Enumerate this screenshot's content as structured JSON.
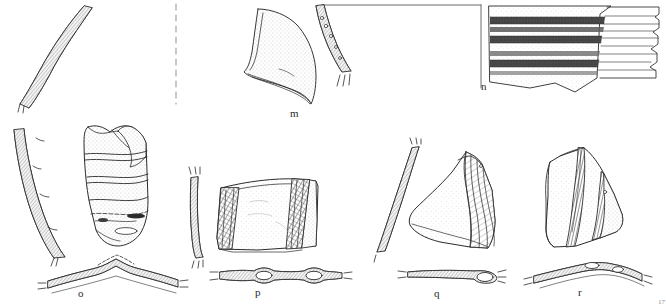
{
  "plate": {
    "title": "Archaeological pottery and artifact profile plate",
    "background_color": "#ffffff",
    "ink_color": "#2b2b2b",
    "stipple_color": "#dcdcdc",
    "hatch_color": "#4a4a4a",
    "band_color": "#3a3a3a",
    "width": 666,
    "height": 306
  },
  "labels": {
    "m": "m",
    "n": "n",
    "o": "o",
    "p": "p",
    "q": "q",
    "r": "r",
    "corner": "17"
  },
  "specimens": [
    {
      "id": "profile-left-top",
      "label": "",
      "description": "S-curved wall profile section, hatched fill, broken ends",
      "views": [
        "section"
      ]
    },
    {
      "id": "m",
      "label": "m",
      "description": "Flared rim / spout fragment with stippled surface and separate curved wall section with perforations",
      "views": [
        "exterior",
        "section"
      ]
    },
    {
      "id": "n",
      "label": "n",
      "description": "Body sherd with horizontal painted dark bands and ribbed profile drawing at right",
      "views": [
        "exterior",
        "profile"
      ],
      "bands": 6
    },
    {
      "id": "o",
      "label": "o",
      "description": "Large body sherd with stippled surface, horizontal incised lines, curved wall section at left and arched cross-section below",
      "views": [
        "section",
        "exterior",
        "cross-section"
      ]
    },
    {
      "id": "p",
      "label": "p",
      "description": "Rectangular sherd with two diagonal cross-hatched bands, wall section at left and horizontal cross-section with two loop handles below",
      "views": [
        "section",
        "exterior",
        "cross-section"
      ]
    },
    {
      "id": "q",
      "label": "q",
      "description": "Triangular sherd with diagonal striations, curved wall section at left and elongated cross-section with loop below",
      "views": [
        "section",
        "exterior",
        "cross-section"
      ]
    },
    {
      "id": "r",
      "label": "r",
      "description": "Sherd with vertical hatched bands and arched cross-section with knob below",
      "views": [
        "exterior",
        "cross-section"
      ]
    }
  ],
  "guides": {
    "dashed_divider": "vertical dashed separator line",
    "top_rule": "horizontal reference rule",
    "axis_rule": "vertical axis rule left of specimen n"
  }
}
